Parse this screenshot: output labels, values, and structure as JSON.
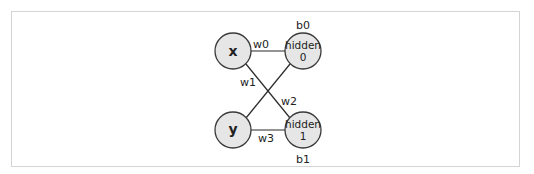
{
  "diagram": {
    "type": "neural-network",
    "input_nodes": [
      {
        "id": "x",
        "label": "x"
      },
      {
        "id": "y",
        "label": "y"
      }
    ],
    "hidden_nodes": [
      {
        "id": "h0",
        "label_line1": "hidden",
        "label_line2": "0",
        "bias": "b0"
      },
      {
        "id": "h1",
        "label_line1": "hidden",
        "label_line2": "1",
        "bias": "b1"
      }
    ],
    "edges": [
      {
        "from": "x",
        "to": "h0",
        "weight": "w0"
      },
      {
        "from": "x",
        "to": "h1",
        "weight": "w1"
      },
      {
        "from": "y",
        "to": "h0",
        "weight": "w2"
      },
      {
        "from": "y",
        "to": "h1",
        "weight": "w3"
      }
    ],
    "colors": {
      "node_fill": "#e6e6e6",
      "node_stroke": "#3a3a3a",
      "edge": "#2a2a2a",
      "frame": "#d4d4d4"
    }
  }
}
